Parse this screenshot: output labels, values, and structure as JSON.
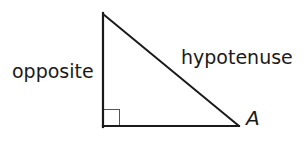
{
  "diagram": {
    "type": "right-triangle",
    "labels": {
      "opposite": "opposite",
      "hypotenuse": "hypotenuse",
      "angle": "A"
    },
    "colors": {
      "stroke": "#1a1a1a",
      "right_angle_marker": "#555555",
      "background": "#ffffff"
    },
    "vertices": {
      "top": [
        103,
        14
      ],
      "right_angle": [
        103,
        126
      ],
      "angle_A": [
        238,
        126
      ]
    }
  }
}
